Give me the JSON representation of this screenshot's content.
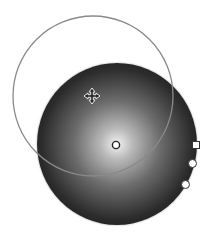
{
  "canvas": {
    "background": "#ffffff",
    "gradient": {
      "type": "radial",
      "stops": [
        "#f2f2f2",
        "#b8b8b8",
        "#6c6c6c",
        "#2c2c2c",
        "#141414"
      ]
    },
    "focus_ring": {
      "color": "#8a8a8a"
    },
    "handles": {
      "center": "center-handle",
      "move": "move-cursor-icon",
      "radius": "radius-handle-square",
      "angle": "angle-handle",
      "aspect": "aspect-handle"
    }
  }
}
